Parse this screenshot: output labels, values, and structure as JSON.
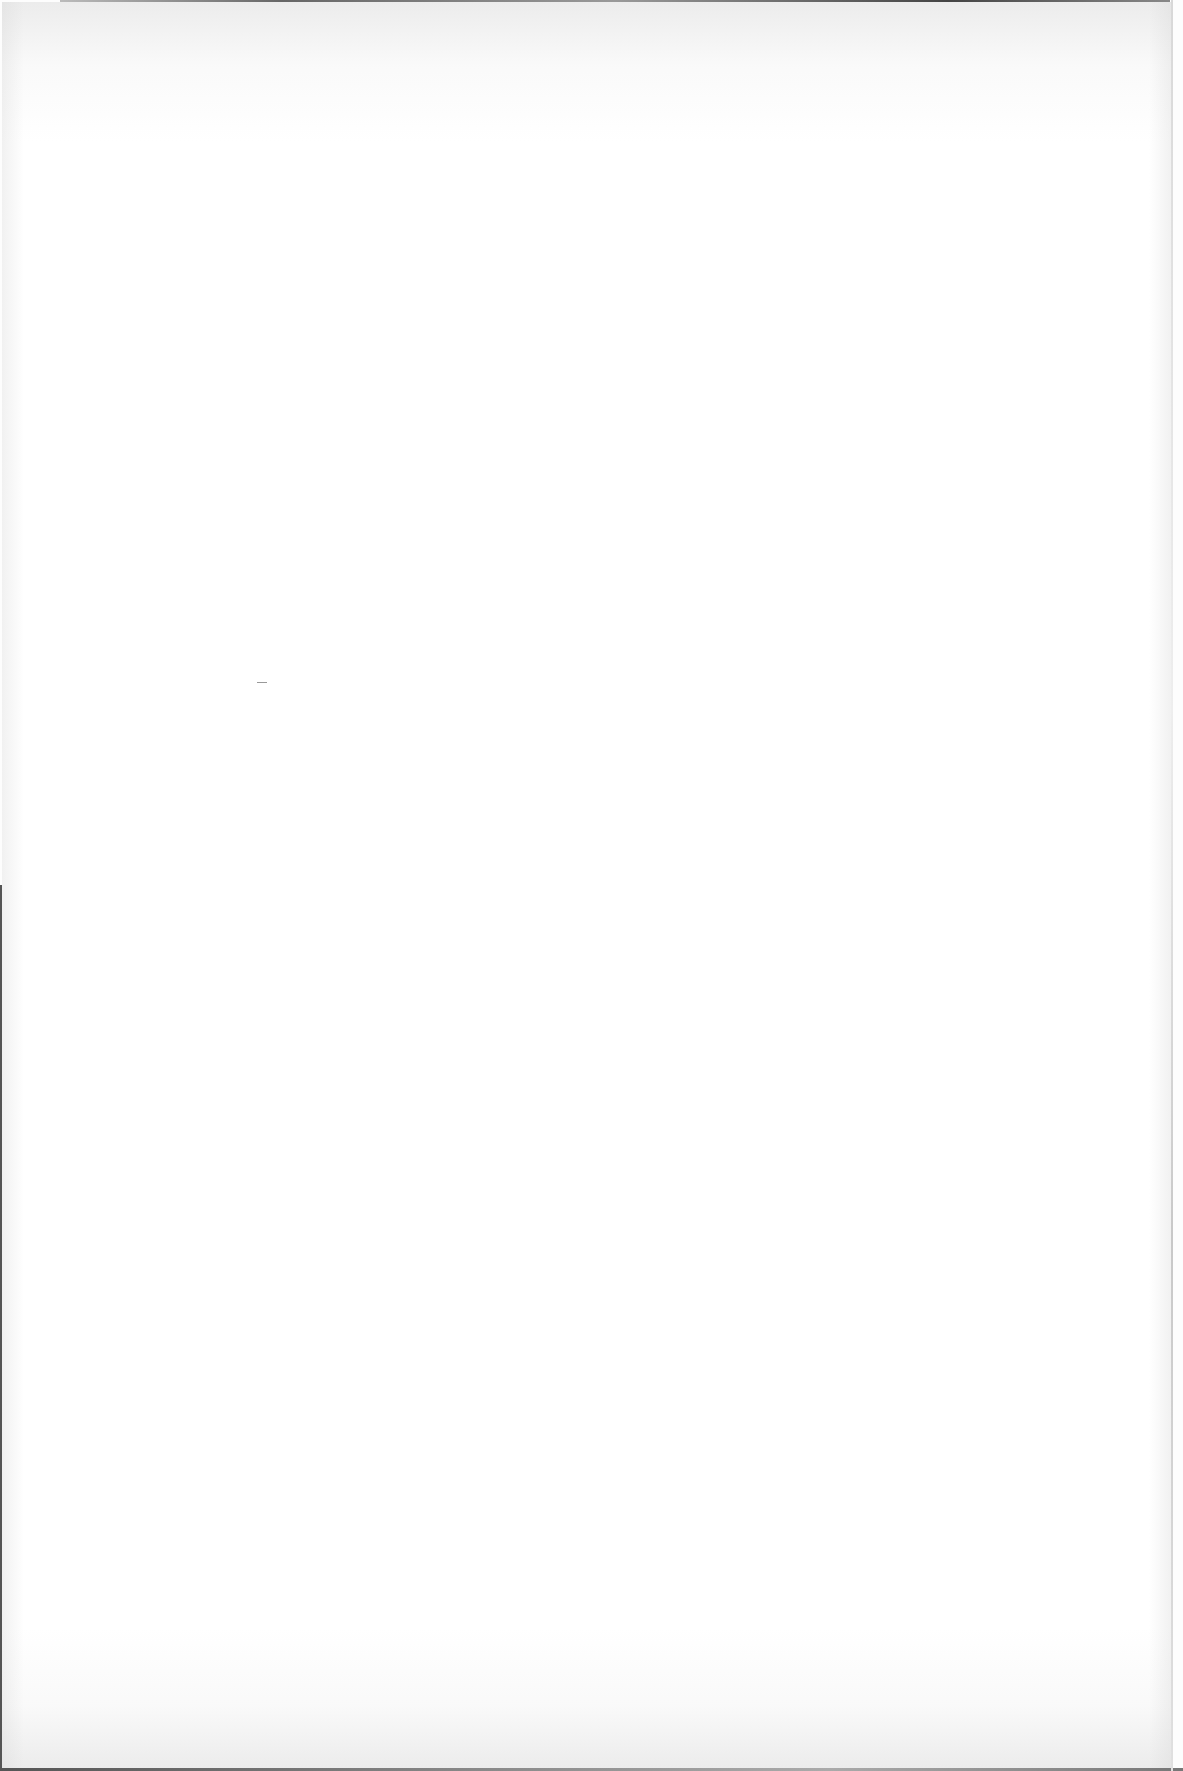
{
  "document": {
    "type": "blank scanned page",
    "visible_text": ""
  },
  "colors": {
    "paper": "#ffffff",
    "scan_edge": "#555555"
  }
}
